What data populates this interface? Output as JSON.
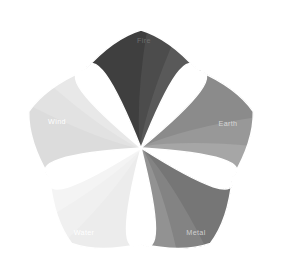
{
  "figure": {
    "background_color": "#ffffff",
    "width": 283,
    "height": 272
  },
  "chart_data": {
    "type": "pie",
    "title": "",
    "subtitle": "",
    "xlabel": "",
    "ylabel": "",
    "legend_position": "none",
    "grid": false,
    "layout": "five-petal radial rosette, petals emanate from a common center, each petal subdivided into curved fan bands that lighten toward the petal's trailing edge",
    "center_x": 141,
    "center_y": 148,
    "petal_count": 5,
    "angles_deg": [
      270,
      342,
      54,
      126,
      198
    ],
    "categories": [
      "Fire",
      "Earth",
      "Metal",
      "Water",
      "Wind"
    ],
    "values": [
      1,
      1,
      1,
      1,
      1
    ],
    "bands_per_petal": 5,
    "series": [
      {
        "name": "Petal base tone",
        "values": [
          0.78,
          0.47,
          0.55,
          0.06,
          0.13
        ]
      }
    ],
    "petals": [
      {
        "label": "Fire",
        "index": 0,
        "angle_deg": 270,
        "label_x": 144,
        "label_y": 43,
        "label_color": "#6f6f6f",
        "base_color": "#3f3f3f",
        "band_colors": [
          "#3f3f3f",
          "#4c4c4c",
          "#595959",
          "#6a6a6a",
          "#7d7d7d"
        ]
      },
      {
        "label": "Earth",
        "index": 1,
        "angle_deg": 342,
        "label_x": 228,
        "label_y": 126,
        "label_color": "#d6d6d6",
        "base_color": "#878787",
        "band_colors": [
          "#8b8b8b",
          "#989898",
          "#a6a6a6",
          "#b5b5b5",
          "#c6c6c6"
        ]
      },
      {
        "label": "Metal",
        "index": 2,
        "angle_deg": 54,
        "label_x": 196,
        "label_y": 235,
        "label_color": "#cfcfcf",
        "base_color": "#787878",
        "band_colors": [
          "#767676",
          "#838383",
          "#929292",
          "#a2a2a2",
          "#b3b3b3"
        ]
      },
      {
        "label": "Water",
        "index": 3,
        "angle_deg": 126,
        "label_x": 84,
        "label_y": 235,
        "label_color": "#ffffff",
        "base_color": "#ececec",
        "band_colors": [
          "#ececec",
          "#f0f0f0",
          "#f4f4f4",
          "#f8f8f8",
          "#fcfcfc"
        ]
      },
      {
        "label": "Wind",
        "index": 4,
        "angle_deg": 198,
        "label_x": 57,
        "label_y": 124,
        "label_color": "#ffffff",
        "base_color": "#dedede",
        "band_colors": [
          "#dcdcdc",
          "#e2e2e2",
          "#e8e8e8",
          "#eeeeee",
          "#f5f5f5"
        ]
      }
    ],
    "separator_color": "#ffffff",
    "separator_width": 1.4
  }
}
